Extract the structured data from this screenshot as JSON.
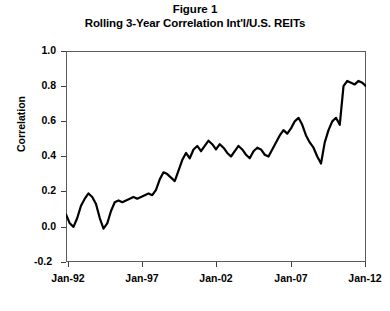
{
  "figure": {
    "title_line1": "Figure 1",
    "title_line2": "Rolling 3-Year Correlation Int'l/U.S. REITs"
  },
  "axes": {
    "y_title": "Correlation",
    "y_ticks": [
      "1.0",
      "0.8",
      "0.6",
      "0.4",
      "0.2",
      "0.0",
      "-0.2"
    ],
    "x_ticks": [
      "Jan-92",
      "Jan-97",
      "Jan-02",
      "Jan-07",
      "Jan-12"
    ]
  },
  "chart_data": {
    "type": "line",
    "xlabel": "",
    "ylabel": "Correlation",
    "ylim": [
      -0.2,
      1.0
    ],
    "xlim": [
      "Jan-92",
      "Jan-12"
    ],
    "grid": false,
    "legend": "none",
    "line_color": "#000000",
    "line_width": 2.2,
    "series": [
      {
        "name": "Rolling 3-Year Correlation Int'l/U.S. REITs",
        "x": [
          "Jan-92",
          "Apr-92",
          "Jul-92",
          "Oct-92",
          "Jan-93",
          "Apr-93",
          "Jul-93",
          "Oct-93",
          "Jan-94",
          "Apr-94",
          "Jul-94",
          "Oct-94",
          "Jan-95",
          "Apr-95",
          "Jul-95",
          "Oct-95",
          "Jan-96",
          "Apr-96",
          "Jul-96",
          "Oct-96",
          "Jan-97",
          "Apr-97",
          "Jul-97",
          "Oct-97",
          "Jan-98",
          "Apr-98",
          "Jul-98",
          "Oct-98",
          "Jan-99",
          "Apr-99",
          "Jul-99",
          "Oct-99",
          "Jan-00",
          "Apr-00",
          "Jul-00",
          "Oct-00",
          "Jan-01",
          "Apr-01",
          "Jul-01",
          "Oct-01",
          "Jan-02",
          "Apr-02",
          "Jul-02",
          "Oct-02",
          "Jan-03",
          "Apr-03",
          "Jul-03",
          "Oct-03",
          "Jan-04",
          "Apr-04",
          "Jul-04",
          "Oct-04",
          "Jan-05",
          "Apr-05",
          "Jul-05",
          "Oct-05",
          "Jan-06",
          "Apr-06",
          "Jul-06",
          "Oct-06",
          "Jan-07",
          "Apr-07",
          "Jul-07",
          "Oct-07",
          "Jan-08",
          "Apr-08",
          "Jul-08",
          "Oct-08",
          "Jan-09",
          "Apr-09",
          "Jul-09",
          "Oct-09",
          "Jan-10",
          "Apr-10",
          "Jul-10",
          "Oct-10",
          "Jan-11",
          "Apr-11",
          "Jul-11",
          "Oct-11",
          "Jan-12"
        ],
        "values": [
          0.07,
          0.02,
          0.0,
          0.05,
          0.12,
          0.16,
          0.19,
          0.17,
          0.13,
          0.05,
          -0.01,
          0.02,
          0.09,
          0.14,
          0.15,
          0.14,
          0.15,
          0.16,
          0.17,
          0.16,
          0.17,
          0.18,
          0.19,
          0.18,
          0.21,
          0.27,
          0.31,
          0.3,
          0.28,
          0.26,
          0.32,
          0.38,
          0.42,
          0.39,
          0.44,
          0.46,
          0.43,
          0.46,
          0.49,
          0.47,
          0.44,
          0.47,
          0.45,
          0.42,
          0.4,
          0.43,
          0.46,
          0.44,
          0.41,
          0.39,
          0.43,
          0.45,
          0.44,
          0.41,
          0.4,
          0.44,
          0.48,
          0.52,
          0.55,
          0.53,
          0.56,
          0.6,
          0.62,
          0.58,
          0.52,
          0.48,
          0.45,
          0.4,
          0.36,
          0.48,
          0.55,
          0.6,
          0.62,
          0.58,
          0.8,
          0.83,
          0.82,
          0.81,
          0.83,
          0.82,
          0.8
        ]
      }
    ],
    "annotations": [
      {
        "label": "start near zero correlation",
        "x": "Jan-92",
        "y": 0.07
      },
      {
        "label": "early trough",
        "x": "Jul-94",
        "y": -0.01
      },
      {
        "label": "2008-09 sharp dip",
        "x": "Jan-09",
        "y": 0.36
      },
      {
        "label": "post-crisis high plateau",
        "x": "Oct-10",
        "y": 0.83
      },
      {
        "label": "final value",
        "x": "Jan-12",
        "y": 0.8
      }
    ]
  }
}
